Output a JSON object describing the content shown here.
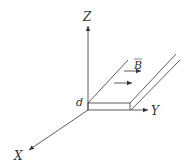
{
  "diagram": {
    "type": "3d-axes-with-conducting-slab",
    "axes": {
      "z_label": "Z",
      "y_label": "Y",
      "x_label": "X"
    },
    "slab": {
      "thickness_label": "d"
    },
    "field": {
      "label": "B",
      "vector_overbar": true,
      "arrow_count": 2,
      "direction": "+Y"
    },
    "colors": {
      "line": "#333333",
      "background": "#ffffff"
    }
  }
}
